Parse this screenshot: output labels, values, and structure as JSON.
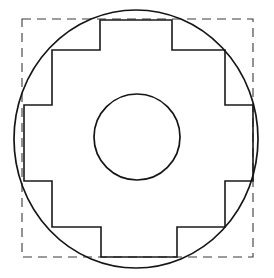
{
  "figure": {
    "background_color": "#ffffff",
    "width": 274,
    "height": 278,
    "shapes": {
      "dashed_square": {
        "name": "dashed-bounding-square",
        "x": 22,
        "y": 19,
        "width": 231,
        "height": 238,
        "stroke_color": "#3a3a3a",
        "stroke_width": 1.1,
        "dash_pattern": "9 6",
        "fill": "none"
      },
      "outer_circle": {
        "name": "outer-circumscribed-circle",
        "cx": 136,
        "cy": 139,
        "rx": 122,
        "ry": 129,
        "stroke_color": "#151515",
        "stroke_width": 1.7,
        "fill": "none"
      },
      "inner_circle": {
        "name": "inner-bore-circle",
        "cx": 137,
        "cy": 137,
        "rx": 43,
        "ry": 43,
        "stroke_color": "#151515",
        "stroke_width": 1.7,
        "fill": "none"
      },
      "cross_polygon": {
        "name": "stepped-cruciform-outline",
        "stroke_color": "#1a1a1a",
        "stroke_width": 1.6,
        "fill": "none",
        "points": [
          [
            100,
            20
          ],
          [
            172,
            20
          ],
          [
            172,
            50
          ],
          [
            225,
            50
          ],
          [
            225,
            105
          ],
          [
            253,
            105
          ],
          [
            253,
            181
          ],
          [
            225,
            181
          ],
          [
            225,
            227
          ],
          [
            177,
            227
          ],
          [
            177,
            257
          ],
          [
            101,
            257
          ],
          [
            101,
            227
          ],
          [
            52,
            227
          ],
          [
            52,
            181
          ],
          [
            24,
            181
          ],
          [
            24,
            105
          ],
          [
            52,
            105
          ],
          [
            52,
            50
          ],
          [
            100,
            50
          ]
        ]
      }
    }
  }
}
